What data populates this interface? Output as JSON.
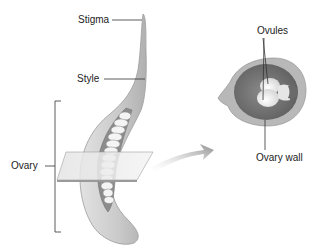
{
  "diagram": {
    "labels": {
      "stigma": "Stigma",
      "style": "Style",
      "ovary": "Ovary",
      "ovules": "Ovules",
      "ovary_wall": "Ovary wall"
    },
    "colors": {
      "pistil_fill": "#cfcfcf",
      "pistil_shade": "#a8a8a8",
      "ovary_interior": "#7a7a7a",
      "ovule_fill": "#f2f2f2",
      "cross_section_outer": "#b5b5b5",
      "cross_section_inner": "#6a6a6a",
      "leader_line": "#333333",
      "arrow": "#9a9a9a"
    }
  }
}
